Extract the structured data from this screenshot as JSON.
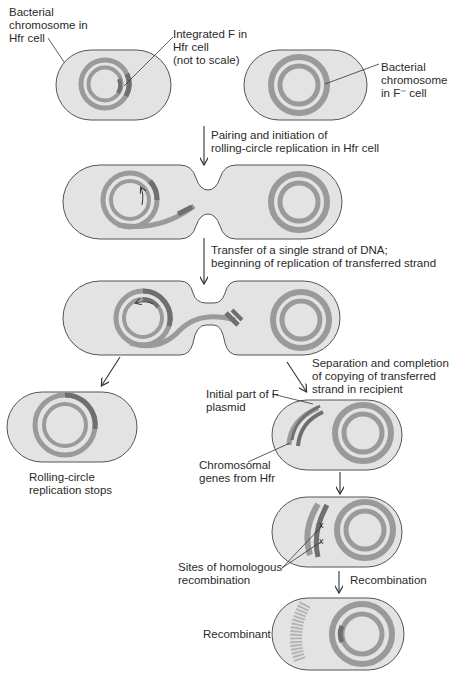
{
  "figure": {
    "colors": {
      "cell_fill": "#e3e3e3",
      "cell_outline": "#555555",
      "chromosome": "#9a9a9a",
      "f_factor": "#6f6f6f",
      "text": "#2a2a2a"
    }
  },
  "labels": {
    "hfr_chromosome": "Bacterial\nchromosome in\nHfr cell",
    "integrated_f": "Integrated F in\nHfr cell\n(not to scale)",
    "fminus_chromosome": "Bacterial\nchromosome\nin F⁻ cell",
    "step1": "Pairing and initiation of\nrolling-circle replication in Hfr cell",
    "step2": "Transfer of a single strand of DNA;\nbeginning of replication of transferred strand",
    "rolling_stops": "Rolling-circle\nreplication stops",
    "step3": "Separation and completion\nof copying of transferred\nstrand in recipient",
    "initial_f": "Initial part of F\nplasmid",
    "chromosomal_genes": "Chromosomal\ngenes from Hfr",
    "homologous_sites": "Sites of homologous\nrecombination",
    "recombination": "Recombination",
    "recombinant": "Recombinant"
  }
}
